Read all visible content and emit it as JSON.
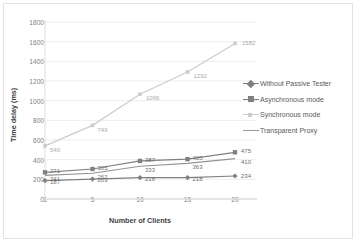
{
  "chart_data": {
    "type": "line",
    "title": "",
    "xlabel": "Number of Clients",
    "ylabel": "Time delay (ms)",
    "categories": [
      "1",
      "5",
      "10",
      "15",
      "20"
    ],
    "x": [
      1,
      5,
      10,
      15,
      20
    ],
    "ylim": [
      0,
      1800
    ],
    "ytick_step": 200,
    "yticks": [
      "1800",
      "1600",
      "1400",
      "1200",
      "1000",
      "800",
      "600",
      "400",
      "200",
      "0"
    ],
    "grid": true,
    "legend_position": "right",
    "series": [
      {
        "name": "Without Passive Tester",
        "values": [
          187,
          203,
          218,
          218,
          234
        ],
        "color": "#7f7f7f",
        "marker": "diamond",
        "labels": [
          "187",
          "203",
          "218",
          "218",
          "234"
        ]
      },
      {
        "name": "Asynchronous mode",
        "values": [
          271,
          305,
          387,
          405,
          475
        ],
        "color": "#808080",
        "marker": "square",
        "labels": [
          "271",
          "305",
          "387",
          "405",
          "475"
        ]
      },
      {
        "name": "Synchronous mode",
        "values": [
          540,
          749,
          1066,
          1292,
          1582
        ],
        "color": "#cccccc",
        "marker": "dot",
        "labels": [
          "540",
          "749",
          "1066",
          "1292",
          "1582"
        ]
      },
      {
        "name": "Transparent Proxy",
        "values": [
          241,
          262,
          333,
          363,
          410
        ],
        "color": "#949494",
        "marker": "none",
        "labels": [
          "241",
          "262",
          "333",
          "363",
          "410"
        ]
      }
    ]
  }
}
